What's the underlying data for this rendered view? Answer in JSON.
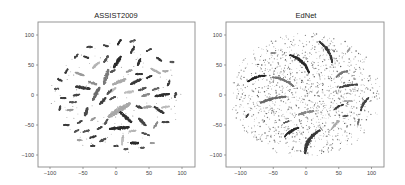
{
  "figure": {
    "panels": [
      {
        "title": "ASSIST2009"
      },
      {
        "title": "EdNet"
      }
    ]
  },
  "chart_data": [
    {
      "type": "scatter",
      "title": "ASSIST2009",
      "xlabel": "",
      "ylabel": "",
      "xlim": [
        -120,
        120
      ],
      "ylim": [
        -120,
        120
      ],
      "xticks": [
        -100,
        -50,
        0,
        50,
        100
      ],
      "yticks": [
        -100,
        -50,
        0,
        50,
        100
      ],
      "grid": false,
      "legend": null,
      "description": "t-SNE style embedding: ~80 small elongated clusters in gray shades (dark, medium, light) distributed in a roughly circular region of radius ~100",
      "clusters": [
        {
          "x": 2,
          "y": 55,
          "len": 22,
          "angle": 60,
          "w": 7,
          "shade": "#2b2b2b"
        },
        {
          "x": 5,
          "y": -55,
          "len": 30,
          "angle": 5,
          "w": 7,
          "shade": "#2b2b2b"
        },
        {
          "x": -15,
          "y": 30,
          "len": 26,
          "angle": 75,
          "w": 7,
          "shade": "#7a7a7a"
        },
        {
          "x": -30,
          "y": 2,
          "len": 24,
          "angle": 65,
          "w": 7,
          "shade": "#6a6a6a"
        },
        {
          "x": -50,
          "y": 12,
          "len": 22,
          "angle": -10,
          "w": 7,
          "shade": "#3a3a3a"
        },
        {
          "x": 5,
          "y": -25,
          "len": 40,
          "angle": 35,
          "w": 12,
          "shade": "#a8a8a8"
        },
        {
          "x": 5,
          "y": 22,
          "len": 22,
          "angle": 25,
          "w": 7,
          "shade": "#aaaaaa"
        },
        {
          "x": 15,
          "y": -37,
          "len": 24,
          "angle": -45,
          "w": 7,
          "shade": "#303030"
        },
        {
          "x": 30,
          "y": 22,
          "len": 18,
          "angle": 30,
          "w": 6,
          "shade": "#3b3b3b"
        },
        {
          "x": 40,
          "y": -45,
          "len": 16,
          "angle": -50,
          "w": 6,
          "shade": "#454545"
        },
        {
          "x": 70,
          "y": 0,
          "len": 22,
          "angle": 10,
          "w": 6,
          "shade": "#2f2f2f"
        },
        {
          "x": 65,
          "y": -25,
          "len": 18,
          "angle": -35,
          "w": 6,
          "shade": "#3a3a3a"
        },
        {
          "x": -45,
          "y": -28,
          "len": 14,
          "angle": 75,
          "w": 6,
          "shade": "#4a4a4a"
        },
        {
          "x": 10,
          "y": -75,
          "len": 16,
          "angle": 85,
          "w": 5,
          "shade": "#c0c0c0"
        },
        {
          "x": 28,
          "y": -80,
          "len": 12,
          "angle": 0,
          "w": 6,
          "shade": "#2a2a2a"
        },
        {
          "x": -20,
          "y": -75,
          "len": 10,
          "angle": 30,
          "w": 5,
          "shade": "#505050"
        },
        {
          "x": 60,
          "y": 40,
          "len": 16,
          "angle": -30,
          "w": 5,
          "shade": "#b0b0b0"
        },
        {
          "x": 35,
          "y": 55,
          "len": 12,
          "angle": 70,
          "w": 5,
          "shade": "#333333"
        },
        {
          "x": 25,
          "y": 75,
          "len": 12,
          "angle": 65,
          "w": 5,
          "shade": "#3b3b3b"
        },
        {
          "x": -15,
          "y": 60,
          "len": 12,
          "angle": 60,
          "w": 5,
          "shade": "#555555"
        },
        {
          "x": -55,
          "y": 35,
          "len": 14,
          "angle": -20,
          "w": 5,
          "shade": "#9a9a9a"
        },
        {
          "x": -35,
          "y": 20,
          "len": 14,
          "angle": -20,
          "w": 5,
          "shade": "#8e8e8e"
        },
        {
          "x": -30,
          "y": 50,
          "len": 14,
          "angle": 45,
          "w": 5,
          "shade": "#b5b5b5"
        },
        {
          "x": -5,
          "y": 8,
          "len": 12,
          "angle": 40,
          "w": 5,
          "shade": "#bcbcbc"
        },
        {
          "x": -20,
          "y": -10,
          "len": 14,
          "angle": 50,
          "w": 6,
          "shade": "#3d3d3d"
        },
        {
          "x": -10,
          "y": 5,
          "len": 10,
          "angle": 50,
          "w": 5,
          "shade": "#555555"
        },
        {
          "x": 20,
          "y": 5,
          "len": 14,
          "angle": 10,
          "w": 5,
          "shade": "#bdbdbd"
        },
        {
          "x": 45,
          "y": 0,
          "len": 12,
          "angle": 20,
          "w": 5,
          "shade": "#888888"
        },
        {
          "x": 48,
          "y": -20,
          "len": 12,
          "angle": 10,
          "w": 5,
          "shade": "#9d9d9d"
        },
        {
          "x": 35,
          "y": -20,
          "len": 10,
          "angle": -20,
          "w": 5,
          "shade": "#444444"
        },
        {
          "x": 40,
          "y": 10,
          "len": 12,
          "angle": 25,
          "w": 5,
          "shade": "#555555"
        },
        {
          "x": 60,
          "y": 10,
          "len": 10,
          "angle": 20,
          "w": 4,
          "shade": "#666666"
        },
        {
          "x": 75,
          "y": -20,
          "len": 12,
          "angle": 10,
          "w": 4,
          "shade": "#bbbbbb"
        },
        {
          "x": 80,
          "y": 20,
          "len": 10,
          "angle": 70,
          "w": 4,
          "shade": "#3a3a3a"
        },
        {
          "x": 90,
          "y": 0,
          "len": 8,
          "angle": 80,
          "w": 4,
          "shade": "#444444"
        },
        {
          "x": 65,
          "y": 60,
          "len": 10,
          "angle": -40,
          "w": 4,
          "shade": "#3a3a3a"
        },
        {
          "x": 50,
          "y": 75,
          "len": 8,
          "angle": 30,
          "w": 4,
          "shade": "#444444"
        },
        {
          "x": 25,
          "y": 90,
          "len": 8,
          "angle": 20,
          "w": 4,
          "shade": "#555555"
        },
        {
          "x": 5,
          "y": 88,
          "len": 10,
          "angle": 60,
          "w": 4,
          "shade": "#2a2a2a"
        },
        {
          "x": -15,
          "y": 82,
          "len": 8,
          "angle": -20,
          "w": 4,
          "shade": "#444444"
        },
        {
          "x": -40,
          "y": 80,
          "len": 8,
          "angle": 0,
          "w": 4,
          "shade": "#444444"
        },
        {
          "x": -45,
          "y": 63,
          "len": 8,
          "angle": -20,
          "w": 4,
          "shade": "#3b3b3b"
        },
        {
          "x": -60,
          "y": 65,
          "len": 8,
          "angle": 50,
          "w": 4,
          "shade": "#444444"
        },
        {
          "x": -75,
          "y": 40,
          "len": 8,
          "angle": 60,
          "w": 4,
          "shade": "#3a3a3a"
        },
        {
          "x": -85,
          "y": 25,
          "len": 8,
          "angle": -30,
          "w": 4,
          "shade": "#3a3a3a"
        },
        {
          "x": -90,
          "y": 10,
          "len": 6,
          "angle": 0,
          "w": 4,
          "shade": "#555555"
        },
        {
          "x": -80,
          "y": -5,
          "len": 8,
          "angle": 0,
          "w": 4,
          "shade": "#3a3a3a"
        },
        {
          "x": -65,
          "y": -12,
          "len": 10,
          "angle": 0,
          "w": 4,
          "shade": "#555555"
        },
        {
          "x": -60,
          "y": 0,
          "len": 10,
          "angle": 10,
          "w": 4,
          "shade": "#444444"
        },
        {
          "x": -85,
          "y": -22,
          "len": 8,
          "angle": 80,
          "w": 4,
          "shade": "#444444"
        },
        {
          "x": -70,
          "y": -25,
          "len": 10,
          "angle": 10,
          "w": 4,
          "shade": "#999999"
        },
        {
          "x": -55,
          "y": -45,
          "len": 8,
          "angle": 30,
          "w": 4,
          "shade": "#444444"
        },
        {
          "x": -75,
          "y": -50,
          "len": 8,
          "angle": 0,
          "w": 4,
          "shade": "#3a3a3a"
        },
        {
          "x": -60,
          "y": -60,
          "len": 8,
          "angle": 30,
          "w": 4,
          "shade": "#555555"
        },
        {
          "x": -45,
          "y": -60,
          "len": 10,
          "angle": 20,
          "w": 4,
          "shade": "#555555"
        },
        {
          "x": -35,
          "y": -70,
          "len": 10,
          "angle": 20,
          "w": 4,
          "shade": "#3a3a3a"
        },
        {
          "x": -55,
          "y": -75,
          "len": 8,
          "angle": 0,
          "w": 4,
          "shade": "#a0a0a0"
        },
        {
          "x": -35,
          "y": -85,
          "len": 6,
          "angle": 0,
          "w": 4,
          "shade": "#3a3a3a"
        },
        {
          "x": -15,
          "y": -45,
          "len": 10,
          "angle": 60,
          "w": 4,
          "shade": "#555555"
        },
        {
          "x": -25,
          "y": -55,
          "len": 8,
          "angle": 30,
          "w": 4,
          "shade": "#454545"
        },
        {
          "x": -35,
          "y": -40,
          "len": 8,
          "angle": 40,
          "w": 4,
          "shade": "#999999"
        },
        {
          "x": 25,
          "y": -60,
          "len": 10,
          "angle": 10,
          "w": 4,
          "shade": "#b5b5b5"
        },
        {
          "x": 45,
          "y": -65,
          "len": 12,
          "angle": -20,
          "w": 4,
          "shade": "#555555"
        },
        {
          "x": 60,
          "y": -50,
          "len": 12,
          "angle": 60,
          "w": 4,
          "shade": "#8a8a8a"
        },
        {
          "x": 75,
          "y": -45,
          "len": 10,
          "angle": 0,
          "w": 4,
          "shade": "#444444"
        },
        {
          "x": 55,
          "y": -80,
          "len": 6,
          "angle": 0,
          "w": 4,
          "shade": "#999999"
        },
        {
          "x": 20,
          "y": 40,
          "len": 10,
          "angle": 20,
          "w": 4,
          "shade": "#999999"
        },
        {
          "x": 50,
          "y": 30,
          "len": 10,
          "angle": 30,
          "w": 4,
          "shade": "#2f2f2f"
        },
        {
          "x": 35,
          "y": 35,
          "len": 10,
          "angle": 0,
          "w": 4,
          "shade": "#333333"
        },
        {
          "x": 75,
          "y": 40,
          "len": 8,
          "angle": 0,
          "w": 4,
          "shade": "#aaaaaa"
        },
        {
          "x": 85,
          "y": 55,
          "len": 6,
          "angle": 0,
          "w": 4,
          "shade": "#555555"
        },
        {
          "x": -5,
          "y": 40,
          "len": 8,
          "angle": 30,
          "w": 4,
          "shade": "#555555"
        },
        {
          "x": -5,
          "y": -5,
          "len": 10,
          "angle": 30,
          "w": 4,
          "shade": "#555555"
        },
        {
          "x": 0,
          "y": -85,
          "len": 6,
          "angle": 0,
          "w": 4,
          "shade": "#444444"
        },
        {
          "x": 15,
          "y": -90,
          "len": 6,
          "angle": 0,
          "w": 4,
          "shade": "#555555"
        },
        {
          "x": 40,
          "y": -88,
          "len": 6,
          "angle": 0,
          "w": 4,
          "shade": "#555555"
        }
      ]
    },
    {
      "type": "scatter",
      "title": "EdNet",
      "xlabel": "",
      "ylabel": "",
      "xlim": [
        -120,
        120
      ],
      "ylim": [
        -120,
        120
      ],
      "xticks": [
        -100,
        -50,
        0,
        50,
        100
      ],
      "yticks": [
        -100,
        -50,
        0,
        50,
        100
      ],
      "grid": false,
      "legend": null,
      "description": "t-SNE style embedding: dense cloud of scattered small dots within radius ~110, with ~15 elongated curved streak clusters radiating in a spiral pattern",
      "streaks": [
        {
          "x": 30,
          "y": 72,
          "len": 40,
          "angle": -60,
          "w": 5,
          "curve": 4,
          "shade": "#3a3a3a"
        },
        {
          "x": -10,
          "y": 52,
          "len": 42,
          "angle": -45,
          "w": 6,
          "curve": 5,
          "shade": "#2a2a2a"
        },
        {
          "x": -75,
          "y": 27,
          "len": 30,
          "angle": 20,
          "w": 4,
          "curve": 3,
          "shade": "#222222"
        },
        {
          "x": -35,
          "y": 22,
          "len": 35,
          "angle": -25,
          "w": 5,
          "curve": 3,
          "shade": "#777777"
        },
        {
          "x": -50,
          "y": -8,
          "len": 40,
          "angle": 15,
          "w": 5,
          "curve": 2,
          "shade": "#6a6a6a"
        },
        {
          "x": 55,
          "y": 35,
          "len": 20,
          "angle": 30,
          "w": 4,
          "curve": 2,
          "shade": "#777777"
        },
        {
          "x": 65,
          "y": 15,
          "len": 28,
          "angle": 10,
          "w": 4,
          "curve": 1,
          "shade": "#444444"
        },
        {
          "x": 90,
          "y": -15,
          "len": 25,
          "angle": 60,
          "w": 4,
          "curve": 2,
          "shade": "#444444"
        },
        {
          "x": 50,
          "y": -20,
          "len": 16,
          "angle": 30,
          "w": 3,
          "curve": 1,
          "shade": "#3a3a3a"
        },
        {
          "x": 0,
          "y": -30,
          "len": 24,
          "angle": 15,
          "w": 6,
          "curve": 1,
          "shade": "#888888"
        },
        {
          "x": -22,
          "y": -62,
          "len": 26,
          "angle": 35,
          "w": 5,
          "curve": 2,
          "shade": "#2a2a2a"
        },
        {
          "x": 10,
          "y": -78,
          "len": 45,
          "angle": 60,
          "w": 7,
          "curve": 6,
          "shade": "#3a3a3a"
        },
        {
          "x": 45,
          "y": -50,
          "len": 18,
          "angle": 50,
          "w": 4,
          "curve": 1,
          "shade": "#aaaaaa"
        },
        {
          "x": 60,
          "y": -35,
          "len": 8,
          "angle": 10,
          "w": 3,
          "curve": 0,
          "shade": "#555555"
        },
        {
          "x": 80,
          "y": -45,
          "len": 10,
          "angle": 80,
          "w": 2,
          "curve": 0,
          "shade": "#666666"
        },
        {
          "x": 65,
          "y": -10,
          "len": 12,
          "angle": 0,
          "w": 3,
          "curve": 0,
          "shade": "#aaaaaa"
        },
        {
          "x": -30,
          "y": -45,
          "len": 8,
          "angle": 20,
          "w": 3,
          "curve": 0,
          "shade": "#555555"
        },
        {
          "x": -90,
          "y": -35,
          "len": 6,
          "angle": 60,
          "w": 2,
          "curve": 0,
          "shade": "#444444"
        },
        {
          "x": -50,
          "y": 70,
          "len": 8,
          "angle": 0,
          "w": 2,
          "curve": 0,
          "shade": "#888888"
        },
        {
          "x": 65,
          "y": 75,
          "len": 8,
          "angle": 60,
          "w": 2,
          "curve": 0,
          "shade": "#999999"
        }
      ],
      "background_points": {
        "count": 1400,
        "radius": 110,
        "center_density": "higher",
        "shade_range": [
          "#555555",
          "#bbbbbb"
        ],
        "size": 0.55
      }
    }
  ]
}
